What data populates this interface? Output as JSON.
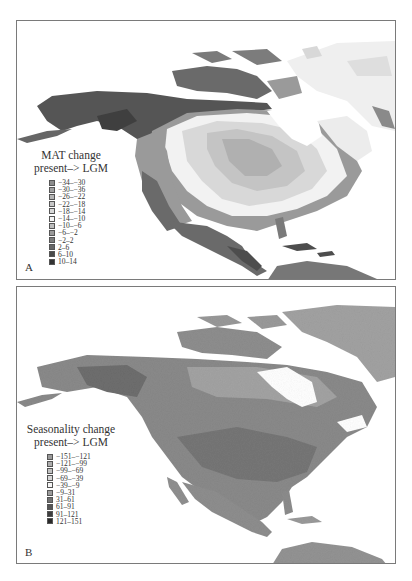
{
  "figure": {
    "panels": [
      {
        "letter": "A",
        "legend": {
          "title_line1": "MAT change",
          "title_line2": "present–> LGM",
          "items": [
            {
              "label": "−34–−30",
              "color": "#8c8c8c"
            },
            {
              "label": "−30–−36",
              "color": "#a0a0a0"
            },
            {
              "label": "−26–−22",
              "color": "#b4b4b4"
            },
            {
              "label": "−22–−18",
              "color": "#c6c6c6"
            },
            {
              "label": "−18–−14",
              "color": "#d8d8d8"
            },
            {
              "label": "−14–−10",
              "color": "#f4f4f4"
            },
            {
              "label": "−10–−6",
              "color": "#bdbdbd"
            },
            {
              "label": "−6–−2",
              "color": "#9a9a9a"
            },
            {
              "label": "−2–2",
              "color": "#7c7c7c"
            },
            {
              "label": "2–6",
              "color": "#666666"
            },
            {
              "label": "6–10",
              "color": "#4a4a4a"
            },
            {
              "label": "10–14",
              "color": "#333333"
            }
          ]
        }
      },
      {
        "letter": "B",
        "legend": {
          "title_line1": "Seasonality change",
          "title_line2": "present–> LGM",
          "items": [
            {
              "label": "−151–−121",
              "color": "#9a9a9a"
            },
            {
              "label": "−121–−99",
              "color": "#adadad"
            },
            {
              "label": "−99–−69",
              "color": "#c2c2c2"
            },
            {
              "label": "−69–−39",
              "color": "#d6d6d6"
            },
            {
              "label": "−39–−9",
              "color": "#f6f6f6"
            },
            {
              "label": "−9–31",
              "color": "#9c9c9c"
            },
            {
              "label": "31–61",
              "color": "#707070"
            },
            {
              "label": "61–91",
              "color": "#555555"
            },
            {
              "label": "91–121",
              "color": "#3e3e3e"
            },
            {
              "label": "121–151",
              "color": "#2a2a2a"
            }
          ]
        }
      }
    ]
  }
}
